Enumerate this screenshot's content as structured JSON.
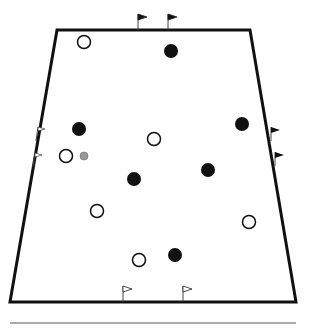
{
  "diagram": {
    "type": "sports-drill-field",
    "colors": {
      "field_line": "#111111",
      "filled_player": "#111111",
      "open_player": "#ffffff",
      "ball": "#999999",
      "baseline": "#aaaaaa"
    },
    "field": {
      "shape": "trapezoid",
      "points": [
        [
          57,
          30
        ],
        [
          250,
          30
        ],
        [
          296,
          302
        ],
        [
          10,
          302
        ]
      ]
    },
    "players_filled": [
      {
        "x": 171,
        "y": 51
      },
      {
        "x": 79,
        "y": 129
      },
      {
        "x": 242,
        "y": 124
      },
      {
        "x": 134,
        "y": 179
      },
      {
        "x": 208,
        "y": 170
      },
      {
        "x": 175,
        "y": 255
      }
    ],
    "players_open": [
      {
        "x": 84,
        "y": 42
      },
      {
        "x": 154,
        "y": 139
      },
      {
        "x": 66,
        "y": 156
      },
      {
        "x": 97,
        "y": 211
      },
      {
        "x": 249,
        "y": 222
      },
      {
        "x": 139,
        "y": 260
      }
    ],
    "ball": {
      "x": 84,
      "y": 156
    },
    "flags_dark": [
      {
        "x": 138,
        "y": 30,
        "dir": "up"
      },
      {
        "x": 168,
        "y": 30,
        "dir": "up"
      },
      {
        "x": 271,
        "y": 127,
        "dir": "right"
      },
      {
        "x": 275,
        "y": 152,
        "dir": "right"
      }
    ],
    "flags_light": [
      {
        "x": 38,
        "y": 127,
        "dir": "left"
      },
      {
        "x": 35,
        "y": 153,
        "dir": "left"
      },
      {
        "x": 123,
        "y": 302,
        "dir": "up"
      },
      {
        "x": 183,
        "y": 302,
        "dir": "up"
      }
    ],
    "baseline": {
      "x1": 10,
      "x2": 296,
      "y": 323
    }
  }
}
